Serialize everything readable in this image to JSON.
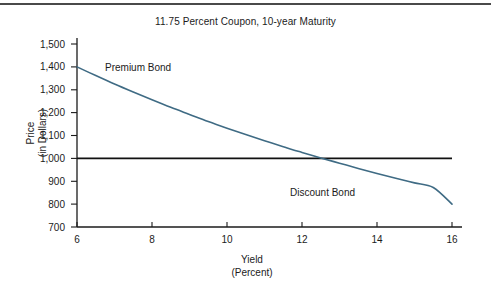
{
  "figure": {
    "background_color": "#ffffff",
    "top_rule_color": "#4a4a4a",
    "bottom_rule_color": "#4a4a4a"
  },
  "chart_data": {
    "type": "line",
    "title": "11.75 Percent Coupon, 10-year Maturity",
    "xlabel_line1": "Yield",
    "xlabel_line2": "(Percent)",
    "ylabel_line1": "Price",
    "ylabel_line2": "(in Dollars)",
    "xlim": [
      6,
      16
    ],
    "ylim": [
      700,
      1500
    ],
    "grid": false,
    "legend": "none",
    "xticks": [
      6,
      8,
      10,
      12,
      14,
      16
    ],
    "xtick_labels": [
      "6",
      "8",
      "10",
      "12",
      "14",
      "16"
    ],
    "yticks": [
      700,
      800,
      900,
      1000,
      1100,
      1200,
      1300,
      1400,
      1500
    ],
    "ytick_labels": [
      "700",
      "800",
      "900",
      "1,000",
      "1,100",
      "1,200",
      "1,300",
      "1,400",
      "1,500"
    ],
    "series": [
      {
        "name": "Bond Price",
        "color": "#3f6b84",
        "x": [
          6,
          6.5,
          7,
          7.5,
          8,
          8.5,
          9,
          9.5,
          10,
          10.5,
          11,
          11.5,
          11.75,
          12,
          12.5,
          13,
          13.5,
          14,
          14.5,
          15,
          15.5,
          16
        ],
        "values": [
          1400,
          1362,
          1325,
          1290,
          1256,
          1223,
          1192,
          1161,
          1132,
          1104,
          1077,
          1051,
          1038,
          1026,
          1002,
          979,
          956,
          934,
          913,
          893,
          873,
          800
        ]
      },
      {
        "name": "Par Value Line",
        "color": "#111111",
        "x": [
          6,
          16
        ],
        "values": [
          1000,
          1000
        ]
      }
    ],
    "annotations": [
      {
        "text": "Premium Bond",
        "x": 7.0,
        "y": 1378
      },
      {
        "text": "Discount Bond",
        "x": 11.9,
        "y": 843
      }
    ],
    "crossover": {
      "x": 11.75,
      "y": 1000
    }
  }
}
